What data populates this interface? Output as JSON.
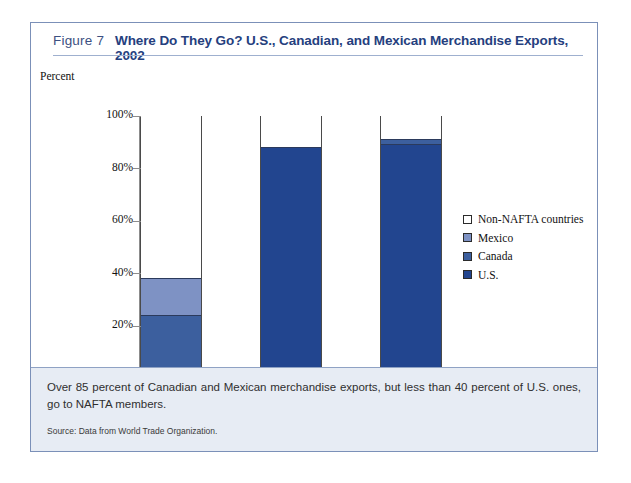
{
  "figure": {
    "label": "Figure 7",
    "title": "Where Do They Go? U.S., Canadian, and Mexican Merchandise Exports, 2002",
    "caption": "Over 85 percent of Canadian and Mexican merchandise exports, but less than 40 percent of U.S. ones, go to NAFTA members.",
    "source": "Source: Data from World Trade Organization."
  },
  "colors": {
    "us": "#22458f",
    "canada": "#3c5f9e",
    "mexico": "#7e92c4",
    "non_nafta": "#ffffff",
    "title": "#25407e",
    "border": "#7b90b8",
    "caption_bg": "#e7ecf4"
  },
  "chart_data": {
    "type": "bar",
    "title": "Where Do They Go? U.S., Canadian, and Mexican Merchandise Exports, 2002",
    "xlabel": "",
    "ylabel": "Percent",
    "ylim": [
      0,
      100
    ],
    "ytick_labels": [
      "0%",
      "20%",
      "40%",
      "60%",
      "80%",
      "100%"
    ],
    "ytick_values": [
      0,
      20,
      40,
      60,
      80,
      100
    ],
    "grid": false,
    "stacked": true,
    "legend_position": "right",
    "categories": [
      "Share of U.S. exports",
      "Share of Canadian exports",
      "Share of Mexican exports"
    ],
    "series": [
      {
        "name": "U.S.",
        "color": "#22458f",
        "values": [
          0,
          88,
          89
        ]
      },
      {
        "name": "Canada",
        "color": "#3c5f9e",
        "values": [
          24,
          0,
          2
        ]
      },
      {
        "name": "Mexico",
        "color": "#7e92c4",
        "values": [
          14,
          0,
          0
        ]
      },
      {
        "name": "Non-NAFTA countries",
        "color": "#ffffff",
        "values": [
          62,
          12,
          9
        ]
      }
    ],
    "legend_order": [
      "Non-NAFTA countries",
      "Mexico",
      "Canada",
      "U.S."
    ]
  }
}
